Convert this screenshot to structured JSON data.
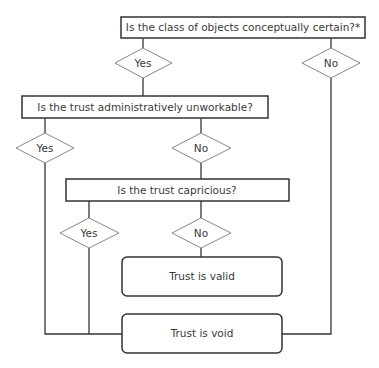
{
  "flowchart": {
    "q1": "Is the class of objects conceptually certain?*",
    "q1_yes": "Yes",
    "q1_no": "No",
    "q2": "Is the trust administratively unworkable?",
    "q2_yes": "Yes",
    "q2_no": "No",
    "q3": "Is the trust capricious?",
    "q3_yes": "Yes",
    "q3_no": "No",
    "outcome_valid": "Trust is valid",
    "outcome_void": "Trust is void"
  },
  "colors": {
    "box_stroke": "#333333",
    "diamond_stroke": "#777777",
    "text": "#3a3a3a"
  }
}
